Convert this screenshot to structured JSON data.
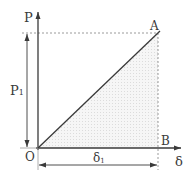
{
  "diagram": {
    "type": "load-displacement",
    "labels": {
      "y_axis": "P",
      "x_axis": "δ",
      "point_top": "A",
      "point_bottom": "B",
      "origin": "O",
      "load_dim": "P",
      "load_dim_sub": "1",
      "disp_dim": "δ",
      "disp_dim_sub": "1"
    },
    "colors": {
      "line": "#3a3a3a",
      "dashed": "#9a9a9a",
      "shade": "#e9e9e9"
    }
  }
}
